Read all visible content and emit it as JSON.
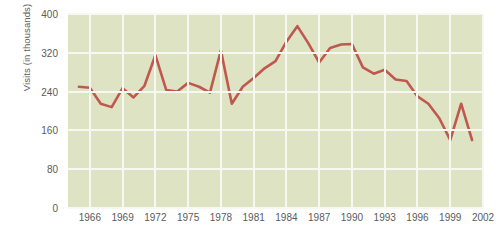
{
  "chart_data": {
    "type": "line",
    "title": "",
    "xlabel": "",
    "ylabel": "Visits (in thousands)",
    "xlim": [
      1964,
      2002
    ],
    "ylim": [
      0,
      400
    ],
    "yticks": [
      0,
      80,
      160,
      240,
      320,
      400
    ],
    "xticks": [
      1966,
      1969,
      1972,
      1975,
      1978,
      1981,
      1984,
      1987,
      1990,
      1993,
      1996,
      1999,
      2002
    ],
    "grid": true,
    "legend": null,
    "line_color": "#c0584f",
    "plot_background": "#dde3c3",
    "gridline_color": "#f7f8f2",
    "x": [
      1965,
      1966,
      1967,
      1968,
      1969,
      1970,
      1971,
      1972,
      1973,
      1974,
      1975,
      1976,
      1977,
      1978,
      1979,
      1980,
      1981,
      1982,
      1983,
      1984,
      1985,
      1986,
      1987,
      1988,
      1989,
      1990,
      1991,
      1992,
      1993,
      1994,
      1995,
      1996,
      1997,
      1998,
      1999,
      2000,
      2001
    ],
    "values": [
      250,
      248,
      215,
      208,
      247,
      228,
      252,
      315,
      243,
      240,
      258,
      250,
      238,
      325,
      215,
      250,
      268,
      288,
      303,
      343,
      375,
      340,
      300,
      330,
      337,
      338,
      290,
      277,
      285,
      265,
      262,
      230,
      215,
      185,
      140,
      215,
      140
    ],
    "series": [
      {
        "name": "Visits",
        "values": [
          250,
          248,
          215,
          208,
          247,
          228,
          252,
          315,
          243,
          240,
          258,
          250,
          238,
          325,
          215,
          250,
          268,
          288,
          303,
          343,
          375,
          340,
          300,
          330,
          337,
          338,
          290,
          277,
          285,
          265,
          262,
          230,
          215,
          185,
          140,
          215,
          140
        ]
      }
    ]
  }
}
